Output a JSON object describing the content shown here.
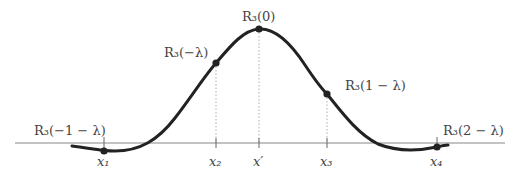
{
  "diagram": {
    "axis": {
      "y": 143,
      "x_start": 15,
      "x_end": 505,
      "color": "#888888"
    },
    "curve": {
      "color": "#222222",
      "width": 3
    },
    "colors": {
      "text": "#444444",
      "point": "#222222",
      "guide": "#999999"
    },
    "points": [
      {
        "id": "x1",
        "x": 104,
        "y": 151,
        "label": "R",
        "label_sub": "3",
        "label_arg": "(−1 − λ)",
        "lx": 34,
        "ly": 134,
        "tick_label": "x",
        "tick_sub": "1"
      },
      {
        "id": "x2",
        "x": 216,
        "y": 63,
        "label": "R",
        "label_sub": "3",
        "label_arg": "(−λ)",
        "lx": 164,
        "ly": 56,
        "tick_label": "x",
        "tick_sub": "2"
      },
      {
        "id": "xprime",
        "x": 259,
        "y": 29,
        "label": "R",
        "label_sub": "3",
        "label_arg": "(0)",
        "lx": 242,
        "ly": 20,
        "tick_label": "x′",
        "tick_sub": ""
      },
      {
        "id": "x3",
        "x": 327,
        "y": 94,
        "label": "R",
        "label_sub": "3",
        "label_arg": "(1 − λ)",
        "lx": 345,
        "ly": 88,
        "tick_label": "x",
        "tick_sub": "3"
      },
      {
        "id": "x4",
        "x": 437,
        "y": 147,
        "label": "R",
        "label_sub": "3",
        "label_arg": "(2 − λ)",
        "lx": 443,
        "ly": 134,
        "tick_label": "x",
        "tick_sub": "4"
      }
    ],
    "labels": {
      "p1": "R₃(−1 − λ)",
      "p2": "R₃(−λ)",
      "p3": "R₃(0)",
      "p4": "R₃(1 − λ)",
      "p5": "R₃(2 − λ)",
      "t1": "x₁",
      "t2": "x₂",
      "t3": "x′",
      "t4": "x₃",
      "t5": "x₄"
    }
  }
}
